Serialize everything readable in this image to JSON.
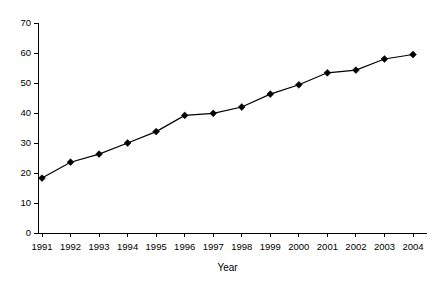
{
  "chart_data": {
    "type": "line",
    "title": "",
    "subtitle": "",
    "xlabel": "Year",
    "ylabel": "",
    "categories": [
      "1991",
      "1992",
      "1993",
      "1994",
      "1995",
      "1996",
      "1997",
      "1998",
      "1999",
      "2000",
      "2001",
      "2002",
      "2003",
      "2004"
    ],
    "values": [
      18.3,
      23.6,
      26.3,
      30.0,
      33.8,
      39.2,
      39.9,
      42.0,
      46.3,
      49.4,
      53.4,
      54.3,
      58.0,
      59.5
    ],
    "series": [
      {
        "name": "",
        "values": [
          18.3,
          23.6,
          26.3,
          30.0,
          33.8,
          39.2,
          39.9,
          42.0,
          46.3,
          49.4,
          53.4,
          54.3,
          58.0,
          59.5
        ]
      }
    ],
    "ylim": [
      0,
      70
    ],
    "ytick_step": 10,
    "ytick_labels": [
      "0",
      "10",
      "20",
      "30",
      "40",
      "50",
      "60",
      "70"
    ],
    "xtick_labels": [
      "1991",
      "1992",
      "1993",
      "1994",
      "1995",
      "1996",
      "1997",
      "1998",
      "1999",
      "2000",
      "2001",
      "2002",
      "2003",
      "2004"
    ],
    "grid": false,
    "legend": false,
    "legend_position": "none",
    "marker": "diamond",
    "line_color": "#000000",
    "marker_color": "#000000",
    "background_color": "#ffffff"
  },
  "axes": {
    "y_axis_name": "value-axis",
    "x_axis_name": "year-axis",
    "x_axis_title": "Year"
  }
}
